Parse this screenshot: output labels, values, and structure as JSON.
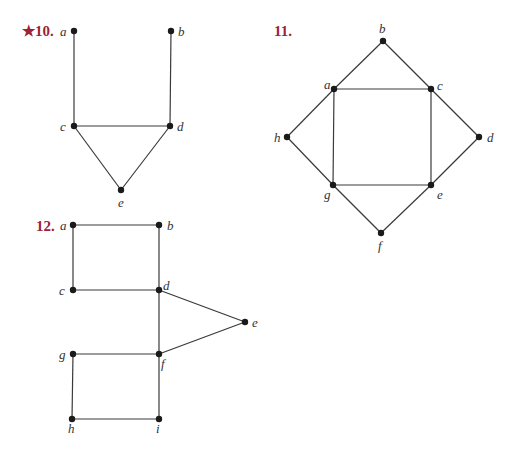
{
  "colors": {
    "problem_number": "#9b2335",
    "edge": "#3a3a3a",
    "vertex": "#1a1a1a",
    "label": "#333333"
  },
  "graphs": [
    {
      "number": "★10.",
      "number_pos": [
        22,
        36
      ],
      "vertices": [
        {
          "id": "a",
          "x": 74,
          "y": 31,
          "lx": 60,
          "ly": 36
        },
        {
          "id": "b",
          "x": 171,
          "y": 31,
          "lx": 178,
          "ly": 36
        },
        {
          "id": "c",
          "x": 74,
          "y": 126,
          "lx": 60,
          "ly": 131
        },
        {
          "id": "d",
          "x": 170,
          "y": 126,
          "lx": 177,
          "ly": 131
        },
        {
          "id": "e",
          "x": 121,
          "y": 190,
          "lx": 118,
          "ly": 207
        }
      ],
      "edges": [
        [
          "a",
          "c"
        ],
        [
          "b",
          "d"
        ],
        [
          "c",
          "d"
        ],
        [
          "c",
          "e"
        ],
        [
          "d",
          "e"
        ]
      ]
    },
    {
      "number": "11.",
      "number_pos": [
        274,
        36
      ],
      "vertices": [
        {
          "id": "b",
          "x": 383,
          "y": 41,
          "lx": 379,
          "ly": 33
        },
        {
          "id": "a",
          "x": 334,
          "y": 89,
          "lx": 324,
          "ly": 89
        },
        {
          "id": "c",
          "x": 431,
          "y": 89,
          "lx": 437,
          "ly": 90
        },
        {
          "id": "h",
          "x": 287,
          "y": 137,
          "lx": 274,
          "ly": 142
        },
        {
          "id": "d",
          "x": 479,
          "y": 137,
          "lx": 487,
          "ly": 142
        },
        {
          "id": "g",
          "x": 333,
          "y": 185,
          "lx": 324,
          "ly": 199
        },
        {
          "id": "e",
          "x": 431,
          "y": 185,
          "lx": 437,
          "ly": 199
        },
        {
          "id": "f",
          "x": 381,
          "y": 233,
          "lx": 378,
          "ly": 250
        }
      ],
      "edges": [
        [
          "b",
          "a"
        ],
        [
          "b",
          "c"
        ],
        [
          "a",
          "c"
        ],
        [
          "a",
          "h"
        ],
        [
          "c",
          "d"
        ],
        [
          "h",
          "g"
        ],
        [
          "d",
          "e"
        ],
        [
          "a",
          "g"
        ],
        [
          "c",
          "e"
        ],
        [
          "g",
          "e"
        ],
        [
          "g",
          "f"
        ],
        [
          "e",
          "f"
        ]
      ]
    },
    {
      "number": "12.",
      "number_pos": [
        36,
        231
      ],
      "vertices": [
        {
          "id": "a",
          "x": 73,
          "y": 225,
          "lx": 60,
          "ly": 230
        },
        {
          "id": "b",
          "x": 159,
          "y": 225,
          "lx": 167,
          "ly": 230
        },
        {
          "id": "c",
          "x": 73,
          "y": 290,
          "lx": 59,
          "ly": 295
        },
        {
          "id": "d",
          "x": 159,
          "y": 290,
          "lx": 163,
          "ly": 290
        },
        {
          "id": "e",
          "x": 245,
          "y": 322,
          "lx": 252,
          "ly": 327
        },
        {
          "id": "g",
          "x": 73,
          "y": 354,
          "lx": 59,
          "ly": 359
        },
        {
          "id": "f",
          "x": 159,
          "y": 354,
          "lx": 161,
          "ly": 368
        },
        {
          "id": "h",
          "x": 72,
          "y": 419,
          "lx": 68,
          "ly": 433
        },
        {
          "id": "i",
          "x": 159,
          "y": 419,
          "lx": 156,
          "ly": 433
        }
      ],
      "edges": [
        [
          "a",
          "b"
        ],
        [
          "a",
          "c"
        ],
        [
          "b",
          "d"
        ],
        [
          "c",
          "d"
        ],
        [
          "d",
          "e"
        ],
        [
          "d",
          "f"
        ],
        [
          "f",
          "e"
        ],
        [
          "g",
          "f"
        ],
        [
          "g",
          "h"
        ],
        [
          "f",
          "i"
        ],
        [
          "h",
          "i"
        ]
      ]
    }
  ]
}
